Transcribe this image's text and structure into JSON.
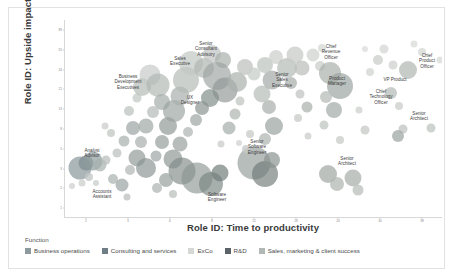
{
  "chart_data": {
    "type": "scatter",
    "title": "",
    "xlabel": "Role ID: Time to productivity",
    "ylabel": "Role ID: Upside impact",
    "grid": false,
    "legend_position": "bottom",
    "legend_title": "Function",
    "xticks": [
      "2",
      "3",
      "6",
      "8",
      "12",
      "18",
      "24",
      "30",
      "38"
    ],
    "yticks": [
      "89",
      "55",
      "34",
      "21",
      "13",
      "8",
      "5",
      "3",
      "2",
      "1"
    ],
    "xlim": [
      1,
      40
    ],
    "ylim": [
      1,
      95
    ],
    "series": [
      {
        "name": "Business operations",
        "color": "#8c9a9e"
      },
      {
        "name": "Consulting and services",
        "color": "#6f7e86"
      },
      {
        "name": "ExCo",
        "color": "#d6d8d6"
      },
      {
        "name": "R&D",
        "color": "#5b6368"
      },
      {
        "name": "Sales, marketing & client success",
        "color": "#b2b8b6"
      }
    ],
    "annotations": [
      {
        "text": "Senior\nConsultant\nAdvisory",
        "x": 196,
        "y": 41,
        "align": "center"
      },
      {
        "text": "Sales\nExecutive",
        "x": 170,
        "y": 53,
        "align": "center"
      },
      {
        "text": "Chief\nRevenue\nOfficer",
        "x": 321,
        "y": 44,
        "align": "center"
      },
      {
        "text": "Chief\nProduct\nOfficer",
        "x": 417,
        "y": 53,
        "align": "center"
      },
      {
        "text": "Senior\nSales\nExecutive",
        "x": 272,
        "y": 72,
        "align": "center"
      },
      {
        "text": "Product\nManager",
        "x": 327,
        "y": 73,
        "align": "center"
      },
      {
        "text": "VP Product",
        "x": 385,
        "y": 72,
        "align": "center"
      },
      {
        "text": "Chief\nTechnology\nOfficer",
        "x": 371,
        "y": 89,
        "align": "center"
      },
      {
        "text": "Business\nDevelopment\nExecutives",
        "x": 118,
        "y": 74,
        "align": "center"
      },
      {
        "text": "UX\nDesigner",
        "x": 180,
        "y": 92,
        "align": "center"
      },
      {
        "text": "Senior\nArchitect",
        "x": 409,
        "y": 108,
        "align": "center"
      },
      {
        "text": "Senior\nSoftware\nEngineer",
        "x": 247,
        "y": 139,
        "align": "center"
      },
      {
        "text": "Senior\nArchitect",
        "x": 337,
        "y": 153,
        "align": "center"
      },
      {
        "text": "Analyst\nAdvisor",
        "x": 82,
        "y": 145,
        "align": "center"
      },
      {
        "text": "Accounts\nAssistant",
        "x": 92,
        "y": 186,
        "align": "center"
      },
      {
        "text": "Software\nEngineer",
        "x": 207,
        "y": 189,
        "align": "center"
      }
    ],
    "points": [
      {
        "x": 70,
        "y": 160,
        "r": 11.5,
        "c": "#8c9a9e",
        "o": 0.72
      },
      {
        "x": 76,
        "y": 155,
        "r": 7.5,
        "c": "#7d8b90",
        "o": 0.7
      },
      {
        "x": 83,
        "y": 153,
        "r": 9.5,
        "c": "#8e9c9e",
        "o": 0.7
      },
      {
        "x": 90,
        "y": 157,
        "r": 6.5,
        "c": "#a7b0ae",
        "o": 0.7
      },
      {
        "x": 96,
        "y": 152,
        "r": 4.5,
        "c": "#b9bfbc",
        "o": 0.75
      },
      {
        "x": 79,
        "y": 169,
        "r": 4.0,
        "c": "#c3c8c5",
        "o": 0.8
      },
      {
        "x": 72,
        "y": 175,
        "r": 3.5,
        "c": "#d2d5d2",
        "o": 0.85
      },
      {
        "x": 86,
        "y": 175,
        "r": 3.0,
        "c": "#cfd3d0",
        "o": 0.85
      },
      {
        "x": 103,
        "y": 171,
        "r": 5.0,
        "c": "#aeb5b2",
        "o": 0.75
      },
      {
        "x": 112,
        "y": 177,
        "r": 6.5,
        "c": "#9aa3a1",
        "o": 0.7
      },
      {
        "x": 107,
        "y": 145,
        "r": 4.5,
        "c": "#bcc2bf",
        "o": 0.75
      },
      {
        "x": 114,
        "y": 133,
        "r": 5.5,
        "c": "#a9b1ae",
        "o": 0.72
      },
      {
        "x": 101,
        "y": 125,
        "r": 4.0,
        "c": "#c5cac6",
        "o": 0.8
      },
      {
        "x": 123,
        "y": 120,
        "r": 7.0,
        "c": "#9ba4a2",
        "o": 0.7
      },
      {
        "x": 119,
        "y": 103,
        "r": 5.0,
        "c": "#bec4c0",
        "o": 0.75
      },
      {
        "x": 127,
        "y": 90,
        "r": 4.5,
        "c": "#c8cdc9",
        "o": 0.8
      },
      {
        "x": 132,
        "y": 79,
        "r": 9.0,
        "c": "#b6bcb8",
        "o": 0.7
      },
      {
        "x": 140,
        "y": 67,
        "r": 10.5,
        "c": "#c6cbc7",
        "o": 0.7
      },
      {
        "x": 148,
        "y": 77,
        "r": 11.5,
        "c": "#b0b7b3",
        "o": 0.68
      },
      {
        "x": 152,
        "y": 94,
        "r": 8.0,
        "c": "#a4acaa",
        "o": 0.7
      },
      {
        "x": 143,
        "y": 104,
        "r": 6.0,
        "c": "#b8bebb",
        "o": 0.75
      },
      {
        "x": 136,
        "y": 118,
        "r": 7.5,
        "c": "#9fa8a5",
        "o": 0.7
      },
      {
        "x": 131,
        "y": 134,
        "r": 6.0,
        "c": "#aab2af",
        "o": 0.72
      },
      {
        "x": 127,
        "y": 150,
        "r": 8.5,
        "c": "#929b99",
        "o": 0.7
      },
      {
        "x": 136,
        "y": 160,
        "r": 10.0,
        "c": "#8a9492",
        "o": 0.68
      },
      {
        "x": 120,
        "y": 162,
        "r": 5.0,
        "c": "#b4bab7",
        "o": 0.75
      },
      {
        "x": 146,
        "y": 148,
        "r": 5.5,
        "c": "#a0a8a6",
        "o": 0.72
      },
      {
        "x": 152,
        "y": 134,
        "r": 7.0,
        "c": "#959e9b",
        "o": 0.7
      },
      {
        "x": 158,
        "y": 118,
        "r": 9.0,
        "c": "#8d9794",
        "o": 0.68
      },
      {
        "x": 164,
        "y": 103,
        "r": 11.0,
        "c": "#9aa3a0",
        "o": 0.68
      },
      {
        "x": 170,
        "y": 88,
        "r": 9.5,
        "c": "#a8afac",
        "o": 0.7
      },
      {
        "x": 176,
        "y": 72,
        "r": 13.0,
        "c": "#b4bab6",
        "o": 0.68
      },
      {
        "x": 181,
        "y": 55,
        "r": 12.0,
        "c": "#c2c7c3",
        "o": 0.7
      },
      {
        "x": 194,
        "y": 60,
        "r": 10.0,
        "c": "#b0b6b2",
        "o": 0.7
      },
      {
        "x": 202,
        "y": 46,
        "r": 9.0,
        "c": "#bfc4c0",
        "o": 0.72
      },
      {
        "x": 213,
        "y": 52,
        "r": 8.0,
        "c": "#a9b0ac",
        "o": 0.7
      },
      {
        "x": 207,
        "y": 68,
        "r": 14.0,
        "c": "#9ba39f",
        "o": 0.66
      },
      {
        "x": 215,
        "y": 82,
        "r": 12.5,
        "c": "#8e9794",
        "o": 0.66
      },
      {
        "x": 200,
        "y": 90,
        "r": 9.0,
        "c": "#7f8a87",
        "o": 0.68
      },
      {
        "x": 192,
        "y": 100,
        "r": 7.0,
        "c": "#8a9490",
        "o": 0.7
      },
      {
        "x": 186,
        "y": 112,
        "r": 6.0,
        "c": "#a0a8a5",
        "o": 0.72
      },
      {
        "x": 178,
        "y": 124,
        "r": 5.0,
        "c": "#b2b8b5",
        "o": 0.75
      },
      {
        "x": 170,
        "y": 136,
        "r": 7.5,
        "c": "#98a19e",
        "o": 0.7
      },
      {
        "x": 163,
        "y": 151,
        "r": 9.5,
        "c": "#8b9592",
        "o": 0.68
      },
      {
        "x": 172,
        "y": 163,
        "r": 13.5,
        "c": "#7f8a87",
        "o": 0.66
      },
      {
        "x": 187,
        "y": 170,
        "r": 15.5,
        "c": "#8a9490",
        "o": 0.64
      },
      {
        "x": 201,
        "y": 176,
        "r": 12.0,
        "c": "#7a8582",
        "o": 0.66
      },
      {
        "x": 210,
        "y": 165,
        "r": 8.5,
        "c": "#6f7b78",
        "o": 0.68
      },
      {
        "x": 156,
        "y": 172,
        "r": 7.0,
        "c": "#99a29f",
        "o": 0.72
      },
      {
        "x": 147,
        "y": 180,
        "r": 5.0,
        "c": "#b0b6b3",
        "o": 0.75
      },
      {
        "x": 163,
        "y": 186,
        "r": 4.0,
        "c": "#c0c5c1",
        "o": 0.8
      },
      {
        "x": 219,
        "y": 120,
        "r": 6.5,
        "c": "#a6aeab",
        "o": 0.72
      },
      {
        "x": 225,
        "y": 106,
        "r": 5.5,
        "c": "#b3b9b6",
        "o": 0.75
      },
      {
        "x": 230,
        "y": 93,
        "r": 4.5,
        "c": "#c6cbc7",
        "o": 0.8
      },
      {
        "x": 227,
        "y": 74,
        "r": 10.0,
        "c": "#aab1ad",
        "o": 0.7
      },
      {
        "x": 235,
        "y": 59,
        "r": 8.0,
        "c": "#bcc1bd",
        "o": 0.72
      },
      {
        "x": 244,
        "y": 66,
        "r": 6.5,
        "c": "#cbcfcb",
        "o": 0.78
      },
      {
        "x": 240,
        "y": 126,
        "r": 4.0,
        "c": "#c9cdc9",
        "o": 0.8
      },
      {
        "x": 244,
        "y": 155,
        "r": 16.5,
        "c": "#8b9492",
        "o": 0.62
      },
      {
        "x": 255,
        "y": 166,
        "r": 13.0,
        "c": "#6f7a77",
        "o": 0.66
      },
      {
        "x": 262,
        "y": 152,
        "r": 8.0,
        "c": "#8a9390",
        "o": 0.7
      },
      {
        "x": 236,
        "y": 141,
        "r": 4.0,
        "c": "#c7cbc8",
        "o": 0.8
      },
      {
        "x": 255,
        "y": 131,
        "r": 6.0,
        "c": "#b2b8b4",
        "o": 0.74
      },
      {
        "x": 264,
        "y": 118,
        "r": 9.0,
        "c": "#9aa29f",
        "o": 0.7
      },
      {
        "x": 259,
        "y": 99,
        "r": 7.0,
        "c": "#a9b0ad",
        "o": 0.72
      },
      {
        "x": 252,
        "y": 86,
        "r": 8.5,
        "c": "#b6bcb8",
        "o": 0.7
      },
      {
        "x": 262,
        "y": 72,
        "r": 9.5,
        "c": "#a2aaa6",
        "o": 0.7
      },
      {
        "x": 255,
        "y": 57,
        "r": 8.0,
        "c": "#c0c5c1",
        "o": 0.74
      },
      {
        "x": 266,
        "y": 49,
        "r": 7.0,
        "c": "#ced2ce",
        "o": 0.78
      },
      {
        "x": 277,
        "y": 60,
        "r": 10.0,
        "c": "#b4bab6",
        "o": 0.7
      },
      {
        "x": 285,
        "y": 47,
        "r": 8.5,
        "c": "#c8ccc8",
        "o": 0.76
      },
      {
        "x": 292,
        "y": 60,
        "r": 7.5,
        "c": "#bbc0bc",
        "o": 0.74
      },
      {
        "x": 281,
        "y": 75,
        "r": 6.0,
        "c": "#aab1ad",
        "o": 0.74
      },
      {
        "x": 290,
        "y": 86,
        "r": 4.5,
        "c": "#c4c8c5",
        "o": 0.8
      },
      {
        "x": 297,
        "y": 99,
        "r": 5.5,
        "c": "#b0b6b2",
        "o": 0.76
      },
      {
        "x": 288,
        "y": 110,
        "r": 4.0,
        "c": "#c9cdc9",
        "o": 0.8
      },
      {
        "x": 303,
        "y": 47,
        "r": 6.5,
        "c": "#d4d7d4",
        "o": 0.82
      },
      {
        "x": 310,
        "y": 58,
        "r": 5.0,
        "c": "#cdd1cd",
        "o": 0.8
      },
      {
        "x": 312,
        "y": 40,
        "r": 4.0,
        "c": "#d8dbd8",
        "o": 0.84
      },
      {
        "x": 320,
        "y": 65,
        "r": 11.0,
        "c": "#aab1ad",
        "o": 0.7
      },
      {
        "x": 330,
        "y": 78,
        "r": 13.0,
        "c": "#9aa29e",
        "o": 0.68
      },
      {
        "x": 316,
        "y": 89,
        "r": 6.0,
        "c": "#b8beba",
        "o": 0.76
      },
      {
        "x": 324,
        "y": 102,
        "r": 8.0,
        "c": "#a4aca8",
        "o": 0.72
      },
      {
        "x": 314,
        "y": 117,
        "r": 4.5,
        "c": "#c6cac7",
        "o": 0.8
      },
      {
        "x": 330,
        "y": 132,
        "r": 4.0,
        "c": "#ccd0cc",
        "o": 0.82
      },
      {
        "x": 318,
        "y": 166,
        "r": 9.0,
        "c": "#9fa7a3",
        "o": 0.7
      },
      {
        "x": 327,
        "y": 176,
        "r": 7.0,
        "c": "#b1b7b3",
        "o": 0.74
      },
      {
        "x": 343,
        "y": 170,
        "r": 8.5,
        "c": "#a8afab",
        "o": 0.72
      },
      {
        "x": 348,
        "y": 182,
        "r": 5.5,
        "c": "#bdc2be",
        "o": 0.78
      },
      {
        "x": 355,
        "y": 122,
        "r": 4.5,
        "c": "#c8ccc8",
        "o": 0.8
      },
      {
        "x": 349,
        "y": 102,
        "r": 3.5,
        "c": "#d2d5d2",
        "o": 0.84
      },
      {
        "x": 360,
        "y": 64,
        "r": 4.0,
        "c": "#d6d9d6",
        "o": 0.84
      },
      {
        "x": 368,
        "y": 52,
        "r": 5.0,
        "c": "#cdd1cd",
        "o": 0.8
      },
      {
        "x": 374,
        "y": 41,
        "r": 4.5,
        "c": "#d9dcd9",
        "o": 0.86
      },
      {
        "x": 381,
        "y": 85,
        "r": 6.0,
        "c": "#bbc0bc",
        "o": 0.78
      },
      {
        "x": 389,
        "y": 98,
        "r": 4.0,
        "c": "#cfd2cf",
        "o": 0.82
      },
      {
        "x": 393,
        "y": 121,
        "r": 4.5,
        "c": "#c3c7c4",
        "o": 0.8
      },
      {
        "x": 388,
        "y": 128,
        "r": 6.0,
        "c": "#9fa7a3",
        "o": 0.74
      },
      {
        "x": 383,
        "y": 57,
        "r": 4.5,
        "c": "#d4d7d4",
        "o": 0.84
      },
      {
        "x": 398,
        "y": 62,
        "r": 9.0,
        "c": "#b2b8b4",
        "o": 0.72
      },
      {
        "x": 412,
        "y": 44,
        "r": 4.0,
        "c": "#dadcda",
        "o": 0.86
      },
      {
        "x": 404,
        "y": 36,
        "r": 3.5,
        "c": "#dee0de",
        "o": 0.88
      },
      {
        "x": 421,
        "y": 120,
        "r": 4.5,
        "c": "#c6cac6",
        "o": 0.82
      },
      {
        "x": 430,
        "y": 52,
        "r": 3.5,
        "c": "#dddfdd",
        "o": 0.88
      },
      {
        "x": 355,
        "y": 41,
        "r": 3.0,
        "c": "#e0e2e0",
        "o": 0.9
      },
      {
        "x": 298,
        "y": 128,
        "r": 3.5,
        "c": "#d0d3d0",
        "o": 0.84
      },
      {
        "x": 211,
        "y": 136,
        "r": 3.5,
        "c": "#cfd2cf",
        "o": 0.84
      },
      {
        "x": 229,
        "y": 135,
        "r": 3.0,
        "c": "#d6d8d6",
        "o": 0.86
      },
      {
        "x": 117,
        "y": 189,
        "r": 3.5,
        "c": "#c2c6c3",
        "o": 0.84
      },
      {
        "x": 62,
        "y": 178,
        "r": 3.0,
        "c": "#d4d6d4",
        "o": 0.86
      },
      {
        "x": 95,
        "y": 118,
        "r": 3.5,
        "c": "#d1d4d1",
        "o": 0.85
      }
    ]
  },
  "legend": {
    "title": "Function",
    "items": [
      {
        "label": "Business operations",
        "color": "#8c9a9e"
      },
      {
        "label": "Consulting and services",
        "color": "#6f7e86"
      },
      {
        "label": "ExCo",
        "color": "#d6d8d6"
      },
      {
        "label": "R&D",
        "color": "#5b6368"
      },
      {
        "label": "Sales, marketing & client success",
        "color": "#b2b8b6"
      }
    ]
  }
}
